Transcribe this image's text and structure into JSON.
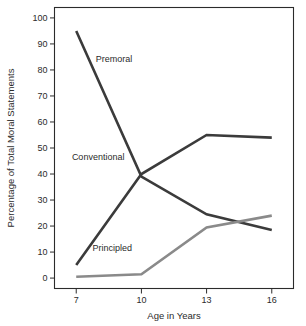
{
  "chart_data": {
    "type": "line",
    "title": "",
    "xlabel": "Age in Years",
    "ylabel": "Percentage of Total Moral Statements",
    "x": [
      7,
      10,
      13,
      16
    ],
    "xticklabels": [
      "7",
      "10",
      "13",
      "16"
    ],
    "yticklabels": [
      "0",
      "10",
      "20",
      "30",
      "40",
      "50",
      "60",
      "70",
      "80",
      "90",
      "100"
    ],
    "yticks": [
      0,
      10,
      20,
      30,
      40,
      50,
      60,
      70,
      80,
      90,
      100
    ],
    "xlim": [
      6,
      17
    ],
    "ylim": [
      -4,
      104
    ],
    "grid": false,
    "legend_position": "inline-annotations",
    "series": [
      {
        "name": "Premoral",
        "values": [
          95,
          39,
          24.5,
          18.5
        ],
        "color": "#3b3b3b",
        "label_x": 7.9,
        "label_y": 83
      },
      {
        "name": "Conventional",
        "values": [
          5,
          40,
          55,
          54
        ],
        "color": "#3b3b3b",
        "label_x": 6.8,
        "label_y": 45.5
      },
      {
        "name": "Principled",
        "values": [
          0.5,
          1.5,
          19.5,
          24
        ],
        "color": "#8a8a8a",
        "label_x": 7.75,
        "label_y": 10.5
      }
    ]
  },
  "axes": {
    "y_title": "Percentage of Total Moral Statements",
    "x_title": "Age in Years",
    "y_ticks": [
      "100",
      "90",
      "80",
      "70",
      "60",
      "50",
      "40",
      "30",
      "20",
      "10",
      "0"
    ],
    "x_ticks": [
      "7",
      "10",
      "13",
      "16"
    ]
  },
  "annotations": {
    "premoral": "Premoral",
    "conventional": "Conventional",
    "principled": "Principled"
  },
  "colors": {
    "dark_line": "#3b3b3b",
    "light_line": "#8a8a8a",
    "frame": "#2b2b2b",
    "text": "#2b2b2b",
    "background": "#ffffff"
  }
}
